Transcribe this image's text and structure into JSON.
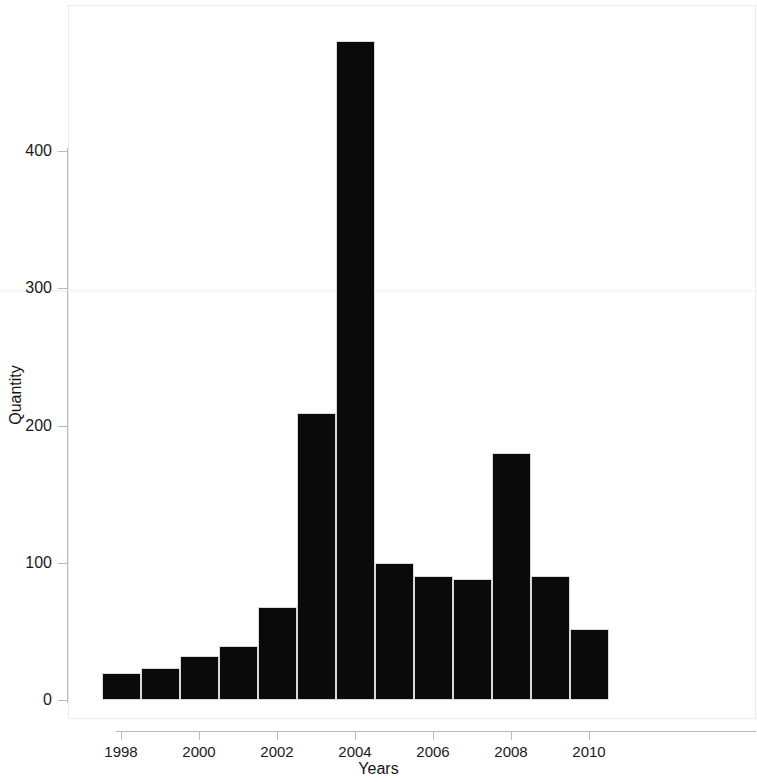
{
  "chart_data": {
    "type": "bar",
    "title": "",
    "xlabel": "Years",
    "ylabel": "Quantity",
    "categories": [
      "1998",
      "1999",
      "2000",
      "2001",
      "2002",
      "2003",
      "2004",
      "2005",
      "2006",
      "2007",
      "2008",
      "2009",
      "2010",
      "2011"
    ],
    "values": [
      20,
      23,
      32,
      39,
      68,
      209,
      480,
      100,
      90,
      88,
      180,
      90,
      52,
      0
    ],
    "bars": [
      {
        "label": "1998",
        "value": 20
      },
      {
        "label": "1999",
        "value": 23
      },
      {
        "label": "2000",
        "value": 32
      },
      {
        "label": "2001",
        "value": 39
      },
      {
        "label": "2002",
        "value": 68
      },
      {
        "label": "2003",
        "value": 209
      },
      {
        "label": "2004",
        "value": 480
      },
      {
        "label": "2005",
        "value": 100
      },
      {
        "label": "2006",
        "value": 90
      },
      {
        "label": "2007",
        "value": 88
      },
      {
        "label": "2008",
        "value": 180
      },
      {
        "label": "2009",
        "value": 90
      },
      {
        "label": "2010",
        "value": 52
      }
    ],
    "ylim": [
      0,
      506
    ],
    "y_ticks": [
      0,
      100,
      200,
      300,
      400
    ],
    "y_tick_labels": [
      "0",
      "100",
      "200",
      "300",
      "400"
    ],
    "x_ticks": [
      "1998",
      "2000",
      "2002",
      "2004",
      "2006",
      "2008",
      "2010"
    ],
    "grid": false,
    "legend": null,
    "bar_color": "#0a0a0a",
    "background_color": "#ffffff",
    "axis_color": "#b9b9b9"
  }
}
